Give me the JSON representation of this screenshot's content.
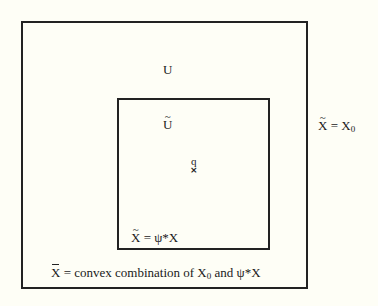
{
  "diagram": {
    "background_color": "#fefef6",
    "line_color": "#222222",
    "outer_region": {
      "label": "U",
      "side_annotation": {
        "symbol": "X",
        "accent": "~",
        "equals": " = ",
        "rhs_base": "X",
        "rhs_subscript": "0"
      },
      "bottom_annotation": {
        "symbol": "X",
        "accent": "bar",
        "text_before": " = convex combination of ",
        "term1_base": "X",
        "term1_subscript": "0",
        "joiner": " and ",
        "term2": "ψ*X"
      }
    },
    "inner_region": {
      "label_base": "U",
      "label_accent": "~",
      "bottom_annotation": {
        "symbol": "X",
        "accent": "~",
        "equals": " = ",
        "rhs": "ψ*X"
      }
    },
    "point": {
      "label": "q",
      "marker": "×"
    }
  }
}
